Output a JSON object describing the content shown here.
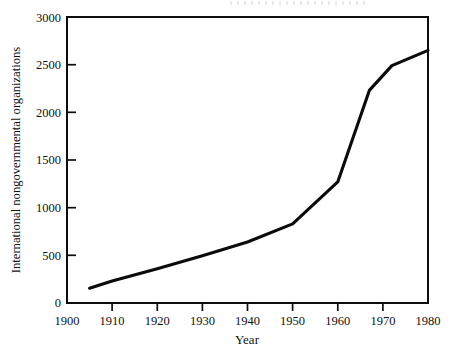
{
  "figure": {
    "background_color": "#ffffff",
    "ink_color": "#0d0d0d"
  },
  "chart_data": {
    "type": "line",
    "title": "",
    "subtitle": "",
    "xlabel": "Year",
    "ylabel": "International nongovernmental organizations",
    "xlim": [
      1900,
      1980
    ],
    "ylim": [
      0,
      3000
    ],
    "grid": false,
    "legend": false,
    "legend_position": "none",
    "x_tick_labels": [
      "1900",
      "1910",
      "1920",
      "1930",
      "1940",
      "1950",
      "1960",
      "1970",
      "1980"
    ],
    "x_ticks": [
      1900,
      1910,
      1920,
      1930,
      1940,
      1950,
      1960,
      1970,
      1980
    ],
    "x_tick_marks_drawn": [
      1910,
      1920,
      1930,
      1940,
      1950,
      1960,
      1970
    ],
    "y_tick_labels": [
      "0",
      "500",
      "1000",
      "1500",
      "2000",
      "2500",
      "3000"
    ],
    "y_ticks": [
      0,
      500,
      1000,
      1500,
      2000,
      2500,
      3000
    ],
    "y_tick_marks_drawn": [
      500,
      1000,
      1500,
      2000,
      2500
    ],
    "series": [
      {
        "name": "International nongovernmental organizations",
        "color": "#0b0b0b",
        "x": [
          1905,
          1910,
          1920,
          1930,
          1940,
          1950,
          1960,
          1967,
          1972,
          1980
        ],
        "values": [
          155,
          230,
          360,
          495,
          640,
          830,
          1270,
          2230,
          2490,
          2650
        ]
      }
    ]
  }
}
